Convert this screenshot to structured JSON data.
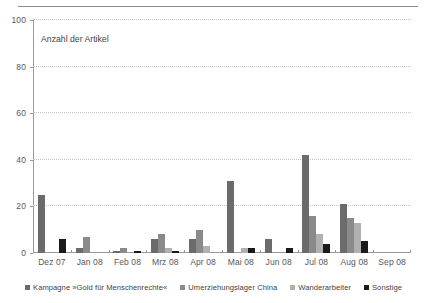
{
  "chart_data": {
    "type": "bar",
    "title": "",
    "subtitle": "",
    "annotation": "Anzahl der Artikel",
    "xlabel": "",
    "ylabel": "Anzahl der Artikel",
    "ylim": [
      0,
      100
    ],
    "yticks": [
      0,
      20,
      40,
      60,
      80,
      100
    ],
    "ytick_labels": [
      "0",
      "20",
      "40",
      "60",
      "80",
      "100"
    ],
    "grid": true,
    "grid_style": "dotted-horizontal",
    "legend_position": "bottom-center",
    "categories": [
      "Dez 07",
      "Jan 08",
      "Feb 08",
      "Mrz 08",
      "Apr 08",
      "Mai 08",
      "Jun 08",
      "Jul 08",
      "Aug 08",
      "Sep 08"
    ],
    "series": [
      {
        "name": "Kampagne »Gold für Menschenrechte«",
        "color": "#6b6b6b",
        "values": [
          25,
          2,
          1,
          6,
          6,
          31,
          6,
          42,
          21,
          0
        ]
      },
      {
        "name": "Umerziehungslager China",
        "color": "#8a8a8a",
        "values": [
          0,
          7,
          2,
          8,
          10,
          0,
          0,
          16,
          15,
          0
        ]
      },
      {
        "name": "Wanderarbeiter",
        "color": "#b0b0b0",
        "values": [
          0,
          0,
          0,
          2,
          3,
          2,
          0,
          8,
          13,
          0
        ]
      },
      {
        "name": "Sonstige",
        "color": "#1a1a1a",
        "values": [
          6,
          0,
          1,
          1,
          0,
          2,
          2,
          4,
          5,
          0
        ]
      }
    ]
  }
}
